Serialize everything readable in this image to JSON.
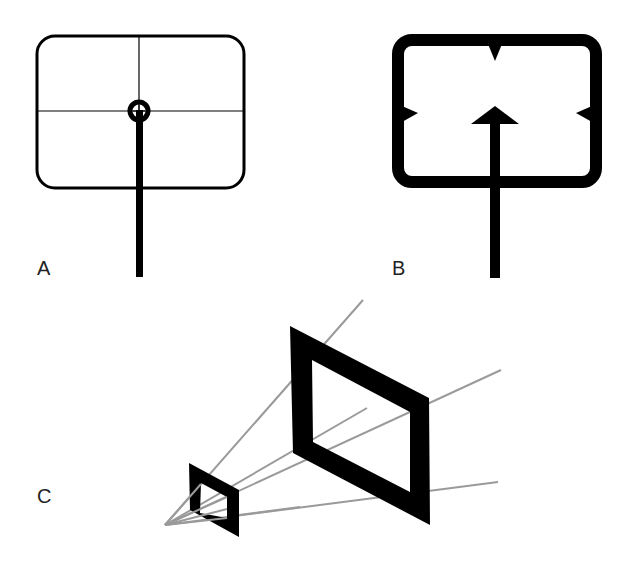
{
  "figure": {
    "panels": [
      {
        "id": "A",
        "label": "A",
        "description": "Thin rounded rectangle with crosshair and ring at center, supported by a thick vertical stick"
      },
      {
        "id": "B",
        "label": "B",
        "description": "Thick rounded rectangle frame with notches on top, left, right; arrow pointing up from below to center"
      },
      {
        "id": "C",
        "label": "C",
        "description": "Perspective projection: small and large parallelogram frames with gray rays from a vanishing point"
      }
    ],
    "colors": {
      "ink": "#000000",
      "ray": "#9a9a9a",
      "background": "#ffffff"
    }
  }
}
